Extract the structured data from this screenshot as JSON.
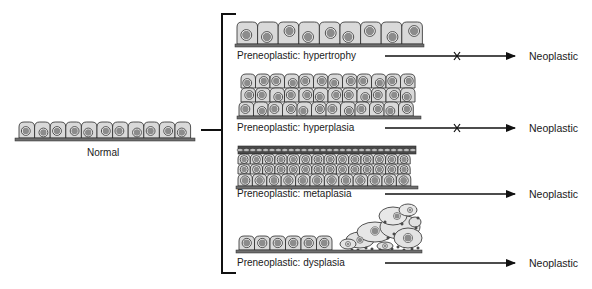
{
  "figure": {
    "normal": {
      "label": "Normal"
    },
    "outcome_label": "Neoplastic",
    "stages": [
      {
        "id": "hypertrophy",
        "label": "Preneoplastic:  hypertrophy",
        "outcome": "Neoplastic",
        "blocked": true
      },
      {
        "id": "hyperplasia",
        "label": "Preneoplastic:  hyperplasia",
        "outcome": "Neoplastic",
        "blocked": true
      },
      {
        "id": "metaplasia",
        "label": "Preneoplastic:  metaplasia",
        "outcome": "Neoplastic",
        "blocked": false
      },
      {
        "id": "dysplasia",
        "label": "Preneoplastic:  dysplasia",
        "outcome": "Neoplastic",
        "blocked": false
      }
    ],
    "icons": {
      "blocked_marker": "x-mark-icon",
      "arrow": "arrow-right-icon"
    },
    "colors": {
      "cell_fill": "#d9d9d9",
      "nucleus_fill": "#8c8c8c",
      "outline": "#2a2a2a",
      "basement": "#6e6e6e",
      "line": "#111111"
    }
  }
}
